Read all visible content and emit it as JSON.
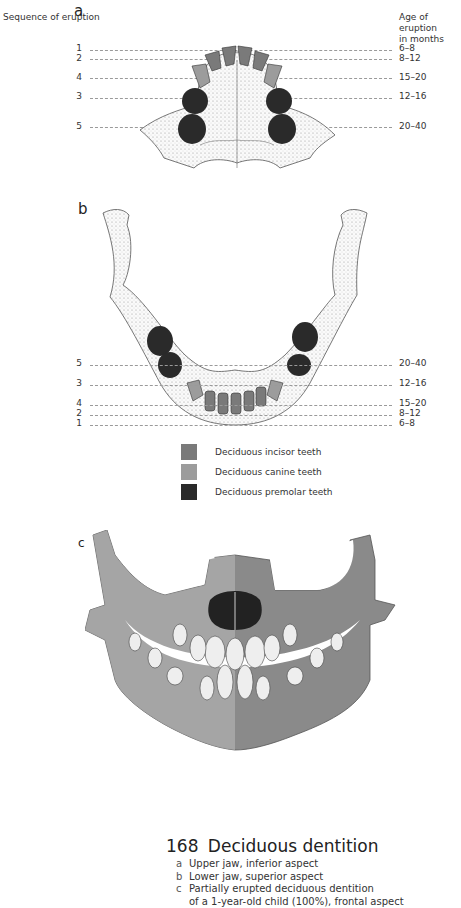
{
  "figure": {
    "number": "168",
    "title": "Deciduous dentition",
    "captions": [
      {
        "letter": "a",
        "text": "Upper jaw, inferior aspect"
      },
      {
        "letter": "b",
        "text": "Lower jaw, superior aspect"
      },
      {
        "letter": "c",
        "text": "Partially erupted deciduous dentition"
      },
      {
        "letter": "",
        "text": "of a 1-year-old child (100%), frontal aspect"
      }
    ]
  },
  "headers": {
    "sequence": "Sequence of eruption",
    "age_line1": "Age of eruption",
    "age_line2": "in months"
  },
  "panels": {
    "a": {
      "label": "a",
      "rows": [
        {
          "seq": "1",
          "age": "6–8"
        },
        {
          "seq": "2",
          "age": "8–12"
        },
        {
          "seq": "4",
          "age": "15–20"
        },
        {
          "seq": "3",
          "age": "12–16"
        },
        {
          "seq": "5",
          "age": "20–40"
        }
      ]
    },
    "b": {
      "label": "b",
      "rows": [
        {
          "seq": "5",
          "age": "20–40"
        },
        {
          "seq": "3",
          "age": "12–16"
        },
        {
          "seq": "4",
          "age": "15–20"
        },
        {
          "seq": "2",
          "age": "8–12"
        },
        {
          "seq": "1",
          "age": "6–8"
        }
      ]
    },
    "c": {
      "label": "c"
    }
  },
  "legend": [
    {
      "label": "Deciduous incisor teeth",
      "color": "#7a7a7a"
    },
    {
      "label": "Deciduous canine teeth",
      "color": "#9c9c9c"
    },
    {
      "label": "Deciduous premolar teeth",
      "color": "#2a2a2a"
    }
  ]
}
